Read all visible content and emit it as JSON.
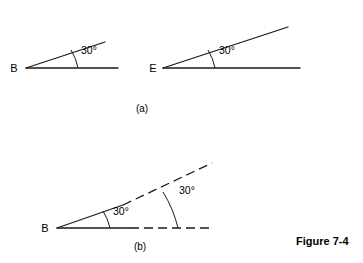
{
  "figure": {
    "caption": "Figure 7-4",
    "parts": [
      {
        "id": "a",
        "label": "(a)",
        "angles": [
          {
            "vertex_label": "B",
            "measure_label": "30°",
            "measure_value": 30,
            "units": "degrees",
            "ray_style": "solid",
            "size": "small"
          },
          {
            "vertex_label": "E",
            "measure_label": "30°",
            "measure_value": 30,
            "units": "degrees",
            "ray_style": "solid",
            "size": "large"
          }
        ]
      },
      {
        "id": "b",
        "label": "(b)",
        "angles": [
          {
            "vertex_label": "B",
            "measure_label": "30°",
            "measure_value": 30,
            "units": "degrees",
            "ray_style": "solid-then-dashed",
            "arc": "inner"
          },
          {
            "vertex_label": "B",
            "measure_label": "30°",
            "measure_value": 30,
            "units": "degrees",
            "ray_style": "solid-then-dashed",
            "arc": "outer"
          }
        ]
      }
    ]
  },
  "colors": {
    "ink": "#1a1a1a",
    "background": "#ffffff"
  }
}
